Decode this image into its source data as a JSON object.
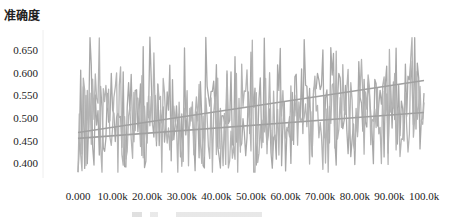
{
  "chart_data": {
    "type": "line",
    "title": "",
    "ylabel": "准确度",
    "xlabel": "",
    "ylim": [
      0.37,
      0.69
    ],
    "xlim": [
      0,
      100000
    ],
    "yticks": [
      "0.650",
      "0.600",
      "0.550",
      "0.500",
      "0.450",
      "0.400"
    ],
    "ytick_values": [
      0.65,
      0.6,
      0.55,
      0.5,
      0.45,
      0.4
    ],
    "xticks": [
      "0.000",
      "10.00k",
      "20.00k",
      "30.00k",
      "40.00k",
      "50.00k",
      "60.00k",
      "70.00k",
      "80.00k",
      "90.00k",
      "100.0k"
    ],
    "xtick_values": [
      0,
      10000,
      20000,
      30000,
      40000,
      50000,
      60000,
      70000,
      80000,
      90000,
      100000
    ],
    "grid": false,
    "series": [
      {
        "name": "accuracy-run-1",
        "color": "#a8a8a8",
        "kind": "noisy",
        "mean_start": 0.5,
        "mean_end": 0.52,
        "min": 0.38,
        "max": 0.68
      },
      {
        "name": "accuracy-run-2",
        "color": "#b4b4b4",
        "kind": "noisy",
        "mean_start": 0.49,
        "mean_end": 0.51,
        "min": 0.38,
        "max": 0.68
      }
    ],
    "trendlines": [
      {
        "name": "trend-upper",
        "color": "#a0a0a0",
        "x": [
          0,
          100000
        ],
        "y": [
          0.468,
          0.583
        ]
      },
      {
        "name": "trend-lower",
        "color": "#a0a0a0",
        "x": [
          0,
          100000
        ],
        "y": [
          0.455,
          0.512
        ]
      }
    ]
  }
}
